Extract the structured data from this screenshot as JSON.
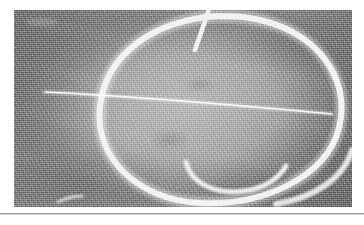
{
  "document": {
    "page_background": "#ffffff",
    "figure_caption": ""
  },
  "figure": {
    "kind": "photograph",
    "frame": {
      "x": 14,
      "y": 10,
      "width": 338,
      "height": 197
    },
    "background_tone": "#8e8e8e",
    "interior_tone": "#bdbdbd",
    "stroke_color": "#f2f2f2",
    "marks": [
      {
        "name": "large-circle-stroke",
        "shape": "open circle / loop",
        "thickness_px": 6
      },
      {
        "name": "horizontal-chord-stroke",
        "shape": "near-horizontal line across the loop",
        "thickness_px": 2
      },
      {
        "name": "top-diagonal-tick-stroke",
        "shape": "short diagonal tick descending from top edge",
        "thickness_px": 4
      },
      {
        "name": "inner-hook-stroke",
        "shape": "small concave hook inside lower-right of the loop",
        "thickness_px": 5
      },
      {
        "name": "bottom-left-speck-stroke",
        "shape": "short faint diagonal mark near bottom-left",
        "thickness_px": 3
      },
      {
        "name": "outer-lower-right-arc-stroke",
        "shape": "secondary arc outside lower-right of the loop",
        "thickness_px": 5
      }
    ]
  },
  "divider": {
    "name": "horizontal-rule",
    "y": 213,
    "color": "#9a9a9a"
  }
}
